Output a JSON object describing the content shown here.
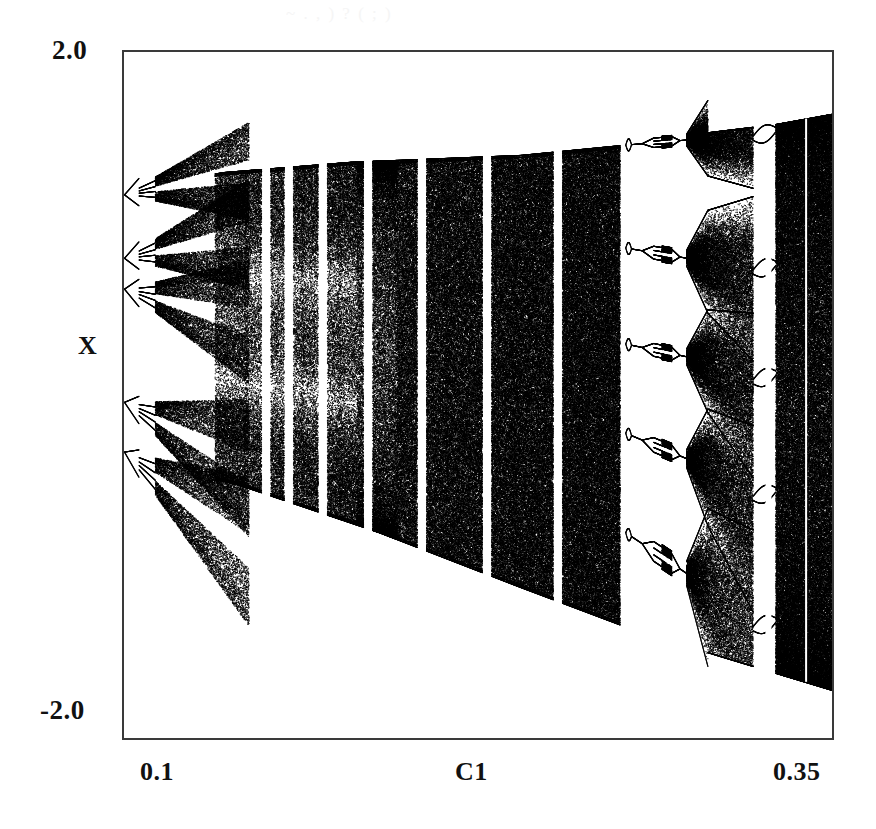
{
  "figure": {
    "name": "bifurcation-diagram",
    "background_color": "#ffffff",
    "ink_color": "#111111",
    "frame_color": "#3a3a3a",
    "scan_artifact_text": "~ . , ) ? ( ; )"
  },
  "axes": {
    "y_top_label": "2.0",
    "y_bottom_label": "-2.0",
    "y_axis_title": "X",
    "x_left_label": "0.1",
    "x_axis_title": "C1",
    "x_right_label": "0.35"
  },
  "chart_data": {
    "type": "scatter",
    "title": "",
    "subtitle": "",
    "xlabel": "C1",
    "ylabel": "X",
    "xlim": [
      0.1,
      0.35
    ],
    "ylim": [
      -2.0,
      2.0
    ],
    "xticks": [
      0.1,
      0.35
    ],
    "xticklabels": [
      "0.1",
      "0.35"
    ],
    "yticks": [
      -2.0,
      2.0
    ],
    "yticklabels": [
      "-2.0",
      "2.0"
    ],
    "grid": false,
    "legend": null,
    "marker_color": "#000000",
    "marker_size_px": 1,
    "regions": [
      {
        "name": "left-cascades",
        "c1_range": [
          0.1,
          0.132
        ],
        "note": "five separate period-doubling cascades with 2-cycle splittings fanning open"
      },
      {
        "name": "chaotic-band-main",
        "c1_range": [
          0.132,
          0.275
        ],
        "note": "dense chaotic attractor, upper envelope near X=1.35 rising slowly, lower envelope descending from X=-0.35 to X=-1.6"
      },
      {
        "name": "periodic-window-wide",
        "c1_range": [
          0.277,
          0.306
        ],
        "note": "wide period-5 window, each of the five branches undergoes its own period-doubling cascade"
      },
      {
        "name": "chaotic-band-right",
        "c1_range": [
          0.306,
          0.322
        ],
        "note": "five-banded chaos widening from the period-5 window"
      },
      {
        "name": "periodic-window-narrow",
        "c1_range": [
          0.322,
          0.33
        ],
        "note": "narrow window"
      },
      {
        "name": "chaotic-band-final",
        "c1_range": [
          0.33,
          0.35
        ],
        "note": "full-width chaos from X=-1.72 up to X=1.64"
      }
    ],
    "branch_families_at_left_edge": [
      {
        "index": 1,
        "x_value": 1.17,
        "note": "uppermost family, already split into 2 bands"
      },
      {
        "index": 2,
        "x_value": 0.8,
        "note": "splits into a 2-cycle fork"
      },
      {
        "index": 3,
        "x_value": 0.62,
        "note": "splits into a 2-cycle fork"
      },
      {
        "index": 4,
        "x_value": -0.04,
        "note": "splits into a 2-cycle fork"
      },
      {
        "index": 5,
        "x_value": -0.33,
        "note": "lowest family at the left edge"
      }
    ],
    "envelope": {
      "upper": [
        {
          "c1": 0.1,
          "x": 1.2
        },
        {
          "c1": 0.135,
          "x": 1.3
        },
        {
          "c1": 0.18,
          "x": 1.36
        },
        {
          "c1": 0.24,
          "x": 1.4
        },
        {
          "c1": 0.277,
          "x": 1.46
        },
        {
          "c1": 0.3,
          "x": 1.52
        },
        {
          "c1": 0.33,
          "x": 1.58
        },
        {
          "c1": 0.35,
          "x": 1.64
        }
      ],
      "lower": [
        {
          "c1": 0.1,
          "x": -0.36
        },
        {
          "c1": 0.14,
          "x": -0.52
        },
        {
          "c1": 0.19,
          "x": -0.8
        },
        {
          "c1": 0.24,
          "x": -1.12
        },
        {
          "c1": 0.277,
          "x": -1.35
        },
        {
          "c1": 0.31,
          "x": -1.52
        },
        {
          "c1": 0.35,
          "x": -1.72
        }
      ]
    },
    "periodic_windows_c1": [
      0.15,
      0.158,
      0.17,
      0.186,
      0.205,
      0.228,
      0.253,
      0.2775,
      0.3225,
      0.3385
    ]
  }
}
